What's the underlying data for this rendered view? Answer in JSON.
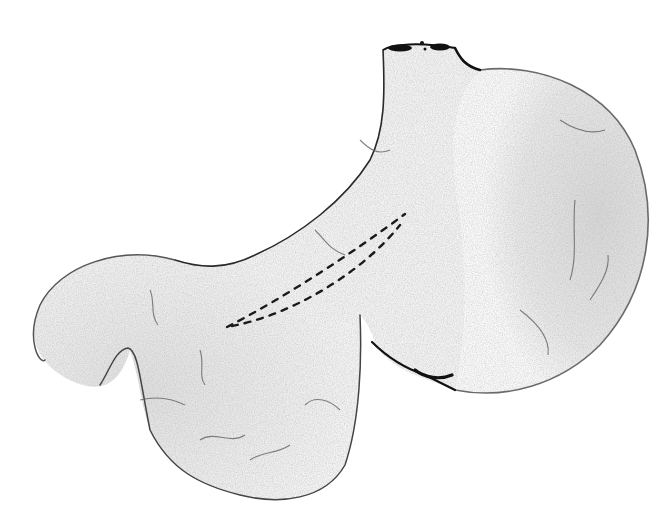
{
  "figure": {
    "annotations": [
      {
        "type": "dashed-outline",
        "description": "narrow elongated dashed region across the lesser-curvature body"
      }
    ],
    "regions": [
      "esophageal-opening",
      "fundus",
      "body",
      "antrum",
      "pylorus-duodenum",
      "greater-curvature",
      "lesser-curvature"
    ],
    "colors": {
      "outline": "#1a1a1a",
      "fill_light": "#f3f3f3",
      "fill_shade": "#d9d9d9",
      "vessel": "#555555",
      "background": "#ffffff"
    }
  },
  "caption": {
    "text": "",
    "visible": "partially clipped at bottom edge"
  }
}
